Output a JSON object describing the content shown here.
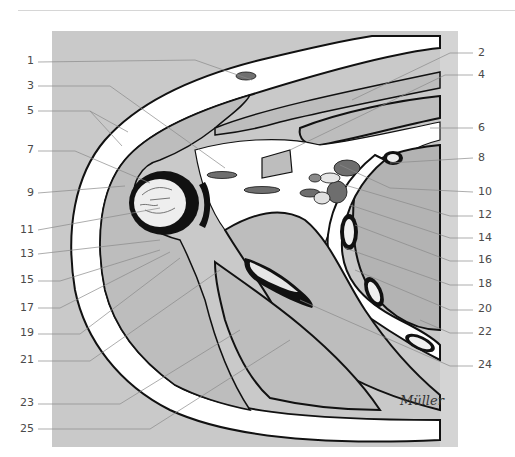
{
  "figure": {
    "signature": "Müller",
    "colors": {
      "background_panel": "#c9c9c9",
      "muscle_fill": "#bdbdbd",
      "fat_fill": "#ffffff",
      "outline": "#111111",
      "vessel_dark": "#6e6e6e",
      "leader_line": "#8a8a8a",
      "label_text": "#4a4a4a"
    }
  },
  "labels": {
    "left": [
      {
        "number": "1",
        "y": 61
      },
      {
        "number": "3",
        "y": 86
      },
      {
        "number": "5",
        "y": 111
      },
      {
        "number": "7",
        "y": 150
      },
      {
        "number": "9",
        "y": 193
      },
      {
        "number": "11",
        "y": 230
      },
      {
        "number": "13",
        "y": 254
      },
      {
        "number": "15",
        "y": 280
      },
      {
        "number": "17",
        "y": 308
      },
      {
        "number": "19",
        "y": 333
      },
      {
        "number": "21",
        "y": 360
      },
      {
        "number": "23",
        "y": 403
      },
      {
        "number": "25",
        "y": 429
      }
    ],
    "right": [
      {
        "number": "2",
        "y": 53
      },
      {
        "number": "4",
        "y": 75
      },
      {
        "number": "6",
        "y": 128
      },
      {
        "number": "8",
        "y": 158
      },
      {
        "number": "10",
        "y": 192
      },
      {
        "number": "12",
        "y": 215
      },
      {
        "number": "14",
        "y": 238
      },
      {
        "number": "16",
        "y": 260
      },
      {
        "number": "18",
        "y": 284
      },
      {
        "number": "20",
        "y": 309
      },
      {
        "number": "22",
        "y": 332
      },
      {
        "number": "24",
        "y": 365
      }
    ]
  }
}
